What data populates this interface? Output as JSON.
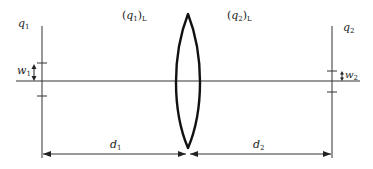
{
  "diagram": {
    "type": "optics-lens-propagation",
    "labels": {
      "q1": {
        "base": "q",
        "sub": "1"
      },
      "q2": {
        "base": "q",
        "sub": "2"
      },
      "q1L": {
        "open": "(",
        "base": "q",
        "sub": "1",
        "close": ")",
        "subscript": "L"
      },
      "q2L": {
        "open": "(",
        "base": "q",
        "sub": "2",
        "close": ")",
        "subscript": "L"
      },
      "w1": {
        "base": "w",
        "sub": "1"
      },
      "w2": {
        "base": "w",
        "sub": "2"
      },
      "d1": {
        "base": "d",
        "sub": "1"
      },
      "d2": {
        "base": "d",
        "sub": "2"
      }
    },
    "colors": {
      "axis": "#777777",
      "lines": "#333333",
      "lens": "#111111",
      "text": "#222222"
    }
  }
}
